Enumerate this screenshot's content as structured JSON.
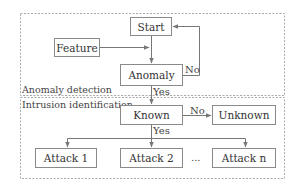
{
  "diagram": {
    "sections": [
      {
        "id": "anomaly",
        "label": "Anomaly detection"
      },
      {
        "id": "intrusion",
        "label": "Intrusion identification"
      }
    ],
    "nodes": {
      "start": "Start",
      "feature": "Feature",
      "anomaly": "Anomaly",
      "known": "Known",
      "unknown": "Unknown",
      "attack1": "Attack 1",
      "attack2": "Attack 2",
      "ellipsis": "...",
      "attackn": "Attack n"
    },
    "edges": [
      {
        "from": "start",
        "to": "anomaly",
        "label": ""
      },
      {
        "from": "feature",
        "to": "anomaly",
        "label": ""
      },
      {
        "from": "anomaly",
        "to": "start",
        "label": "No"
      },
      {
        "from": "anomaly",
        "to": "known",
        "label": "Yes"
      },
      {
        "from": "known",
        "to": "unknown",
        "label": "No"
      },
      {
        "from": "known",
        "to": "attack1",
        "label": "Yes"
      },
      {
        "from": "known",
        "to": "attack2",
        "label": "Yes"
      },
      {
        "from": "known",
        "to": "attackn",
        "label": "Yes"
      }
    ],
    "edge_labels": {
      "anomaly_no": "No",
      "anomaly_yes": "Yes",
      "known_no": "No",
      "known_yes": "Yes"
    }
  }
}
